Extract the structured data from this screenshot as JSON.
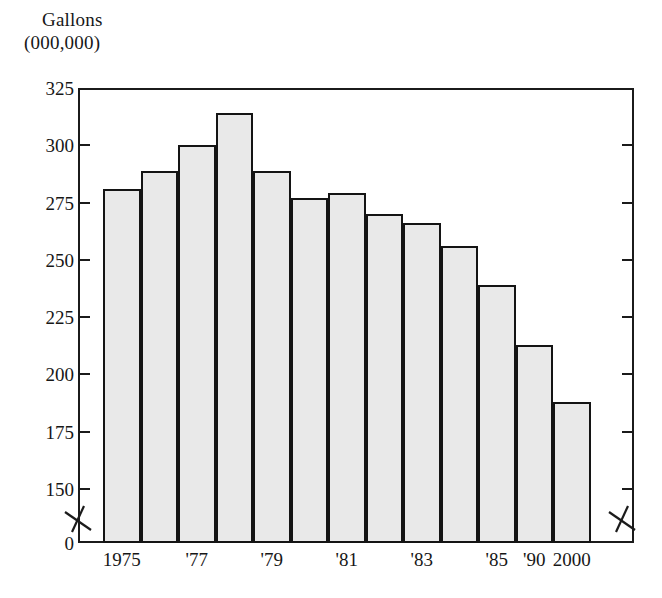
{
  "chart_data": {
    "type": "bar",
    "title": "Gallons (000,000)",
    "title_lines": [
      "Gallons",
      "(000,000)"
    ],
    "xlabel": "",
    "ylabel": "Gallons (000,000)",
    "ylim": [
      0,
      325
    ],
    "y_ticks": [
      325,
      300,
      275,
      250,
      225,
      200,
      175,
      150,
      0
    ],
    "y_axis_break": true,
    "y_axis_break_note": "zigzag break between 150 and 0 on both left and right axes",
    "grid": false,
    "legend": null,
    "categories": [
      "1975",
      "'76",
      "'77",
      "'78",
      "'79",
      "'80",
      "'81",
      "'82",
      "'83",
      "'84",
      "'85",
      "'90",
      "2000"
    ],
    "visible_tick_labels": [
      "1975",
      "'77",
      "'79",
      "'81",
      "'83",
      "'85",
      "'90",
      "2000"
    ],
    "values": [
      281,
      289,
      300,
      314,
      289,
      277,
      279,
      270,
      266,
      256,
      239,
      213,
      188
    ],
    "bar_fill": "#e9e9e9",
    "bar_pattern": "stipple-dots",
    "bar_border": "#141414",
    "axis_color": "#1b1b1b",
    "background": "#ffffff"
  },
  "axis": {
    "title_line1": "Gallons",
    "title_line2": "(000,000)",
    "y_ticks": [
      {
        "label": "325",
        "value": 325
      },
      {
        "label": "300",
        "value": 300
      },
      {
        "label": "275",
        "value": 275
      },
      {
        "label": "250",
        "value": 250
      },
      {
        "label": "225",
        "value": 225
      },
      {
        "label": "200",
        "value": 200
      },
      {
        "label": "175",
        "value": 175
      },
      {
        "label": "150",
        "value": 150
      },
      {
        "label": "0",
        "value": 0
      }
    ],
    "x_ticks": [
      {
        "label": "1975",
        "bar_index": 0
      },
      {
        "label": "'77",
        "bar_index": 2
      },
      {
        "label": "'79",
        "bar_index": 4
      },
      {
        "label": "'81",
        "bar_index": 6
      },
      {
        "label": "'83",
        "bar_index": 8
      },
      {
        "label": "'85",
        "bar_index": 10
      },
      {
        "label": "'90",
        "bar_index": 11
      },
      {
        "label": "2000",
        "bar_index": 12
      }
    ]
  }
}
